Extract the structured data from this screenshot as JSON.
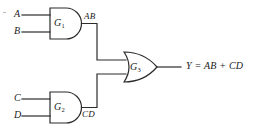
{
  "figure": {
    "kind": "logic-circuit-diagram",
    "stroke_color": "#2b2b2b",
    "background_color": "#ffffff",
    "text_color": "#1a1a1a"
  },
  "inputs": [
    {
      "name": "input-a",
      "label": "A"
    },
    {
      "name": "input-b",
      "label": "B"
    },
    {
      "name": "input-c",
      "label": "C"
    },
    {
      "name": "input-d",
      "label": "D"
    }
  ],
  "gates": [
    {
      "name": "gate-g1",
      "label": "G",
      "subscript": "1",
      "type": "AND"
    },
    {
      "name": "gate-g2",
      "label": "G",
      "subscript": "2",
      "type": "AND"
    },
    {
      "name": "gate-g3",
      "label": "G",
      "subscript": "3",
      "type": "OR"
    }
  ],
  "wire_labels": [
    {
      "name": "wire-label-ab",
      "label": "AB"
    },
    {
      "name": "wire-label-cd",
      "label": "CD"
    }
  ],
  "output": {
    "name": "output-expression",
    "label": "Y = AB + CD"
  }
}
